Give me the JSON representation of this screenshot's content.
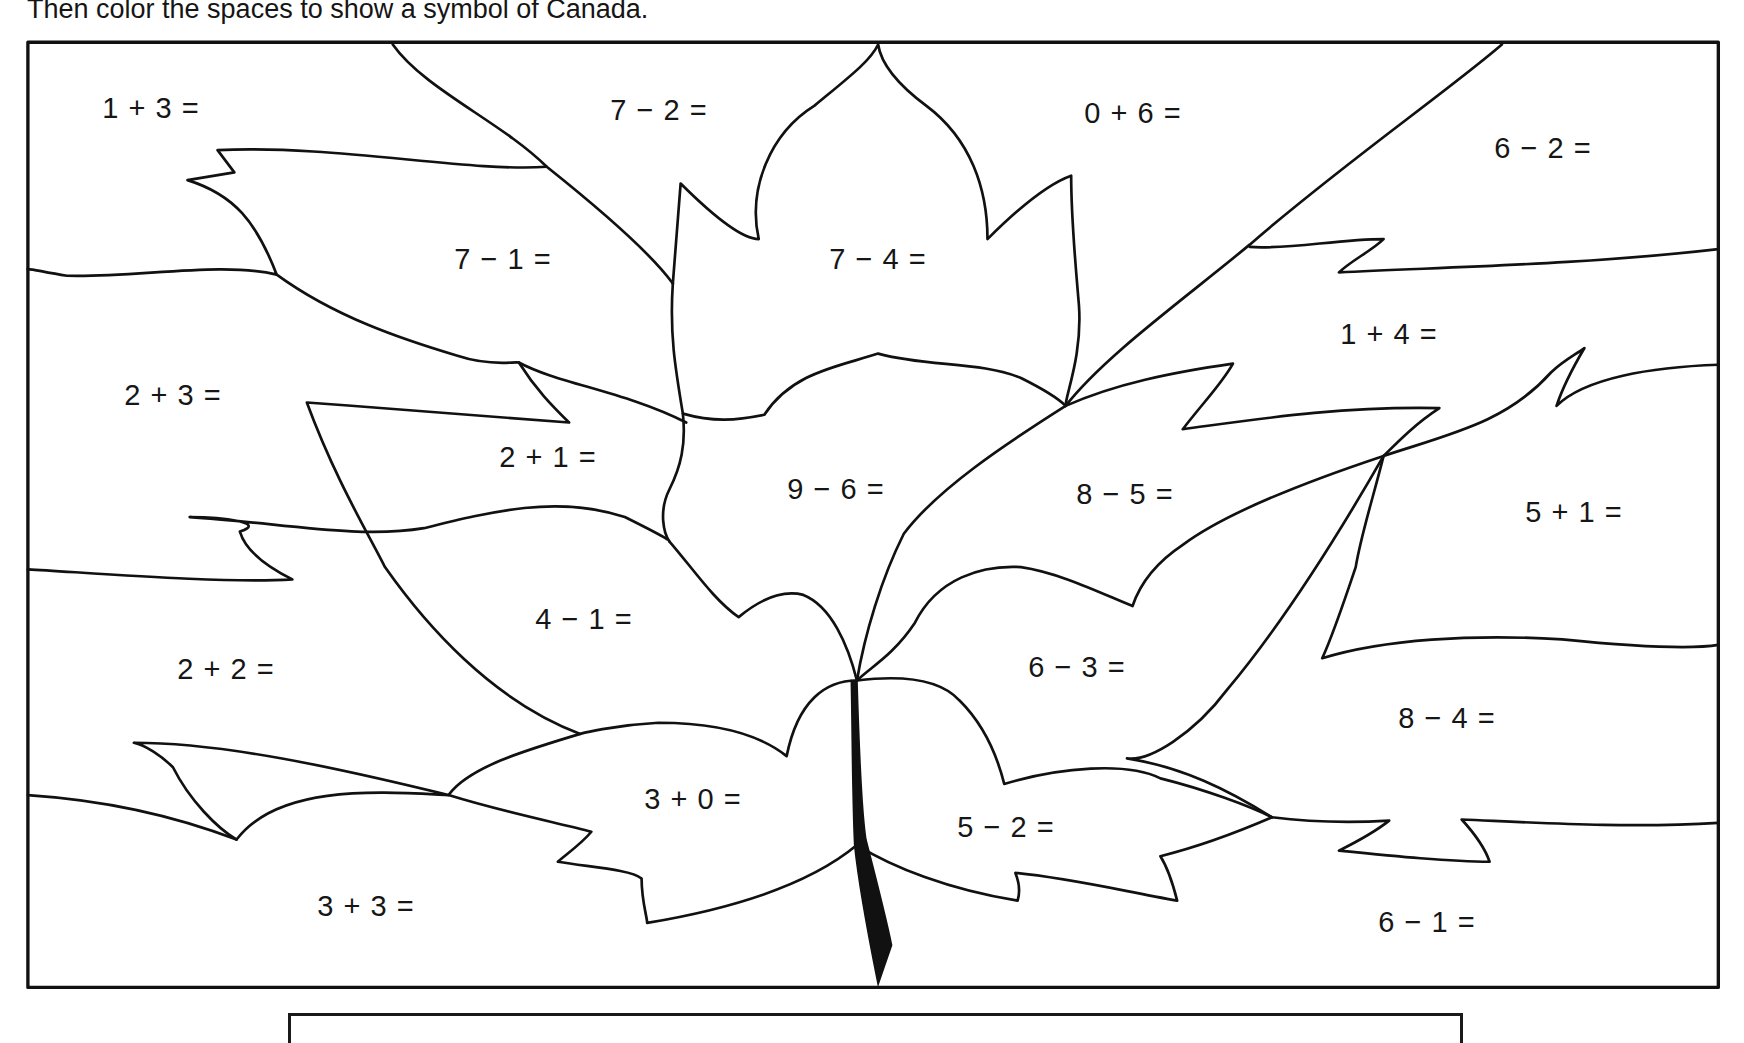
{
  "worksheet": {
    "instruction_cut_line": "",
    "instruction": "Then color the spaces to show a symbol of Canada.",
    "stroke_color": "#111111",
    "stem_fill": "#111111"
  },
  "regions": [
    {
      "id": "r1",
      "label": "1 + 3 =",
      "x": 151,
      "y": 108
    },
    {
      "id": "r2",
      "label": "7 − 2 =",
      "x": 659,
      "y": 110
    },
    {
      "id": "r3",
      "label": "0 + 6 =",
      "x": 1133,
      "y": 113
    },
    {
      "id": "r4",
      "label": "6 − 2 =",
      "x": 1543,
      "y": 148
    },
    {
      "id": "r5",
      "label": "7 − 1 =",
      "x": 503,
      "y": 259
    },
    {
      "id": "r6",
      "label": "7 − 4 =",
      "x": 878,
      "y": 259
    },
    {
      "id": "r7",
      "label": "1 + 4 =",
      "x": 1389,
      "y": 334
    },
    {
      "id": "r8",
      "label": "2 + 3 =",
      "x": 173,
      "y": 395
    },
    {
      "id": "r9",
      "label": "2 + 1 =",
      "x": 548,
      "y": 457
    },
    {
      "id": "r10",
      "label": "9 − 6 =",
      "x": 836,
      "y": 489
    },
    {
      "id": "r11",
      "label": "8 − 5 =",
      "x": 1125,
      "y": 494
    },
    {
      "id": "r12",
      "label": "5 + 1 =",
      "x": 1574,
      "y": 512
    },
    {
      "id": "r13",
      "label": "4 − 1 =",
      "x": 584,
      "y": 619
    },
    {
      "id": "r14",
      "label": "2 + 2 =",
      "x": 226,
      "y": 669
    },
    {
      "id": "r15",
      "label": "6 − 3 =",
      "x": 1077,
      "y": 667
    },
    {
      "id": "r16",
      "label": "8 − 4 =",
      "x": 1447,
      "y": 718
    },
    {
      "id": "r17",
      "label": "3 + 0 =",
      "x": 693,
      "y": 799
    },
    {
      "id": "r18",
      "label": "5 − 2 =",
      "x": 1006,
      "y": 827
    },
    {
      "id": "r19",
      "label": "3 + 3 =",
      "x": 366,
      "y": 906
    },
    {
      "id": "r20",
      "label": "6 − 1 =",
      "x": 1427,
      "y": 922
    }
  ]
}
